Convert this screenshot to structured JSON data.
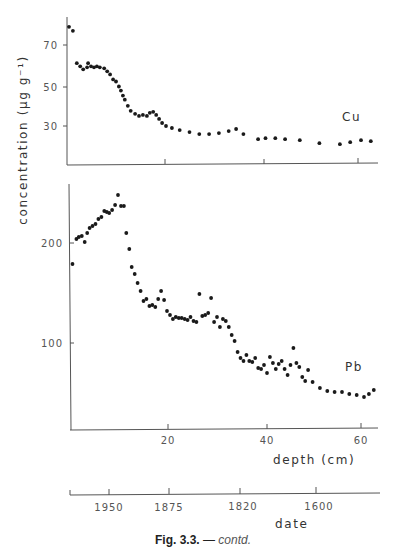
{
  "figure": {
    "caption_label": "Fig. 3.3.",
    "caption_sep": " — ",
    "caption_suffix": "contd."
  },
  "y_axis_title": "concentration (μg g⁻¹)",
  "chart_data": [
    {
      "type": "scatter",
      "title": "Cu",
      "panel_label": "Cu",
      "xlabel": "depth (cm)",
      "ylabel": "concentration (μg g⁻¹)",
      "xlim": [
        0,
        63
      ],
      "ylim": [
        10.5,
        84
      ],
      "xticks": [
        20,
        40,
        60
      ],
      "yticks": [
        30,
        50,
        70
      ],
      "grid": false,
      "x": [
        0.4,
        1.2,
        2,
        2.7,
        3.3,
        4.1,
        4.3,
        4.9,
        5.5,
        6.1,
        6.7,
        7.6,
        8.2,
        8.8,
        9.4,
        10,
        10.6,
        11,
        11.4,
        11.8,
        12.4,
        13,
        13.9,
        14.7,
        15.5,
        16.3,
        16.9,
        17.6,
        18.2,
        18.8,
        19.4,
        20.2,
        21.4,
        23,
        25,
        27,
        29,
        31,
        33,
        34.5,
        36,
        39,
        40.5,
        42.5,
        44.5,
        47.5,
        51.5,
        55.7,
        57.8,
        60,
        62
      ],
      "y": [
        79,
        77,
        61,
        59.5,
        58,
        59,
        61,
        59.5,
        59,
        59.5,
        59,
        58.5,
        57,
        55.5,
        53,
        52,
        49.5,
        47.5,
        45,
        43,
        40,
        37.5,
        36,
        35,
        35.5,
        35,
        36.5,
        37,
        35.5,
        33.5,
        31.5,
        30,
        29,
        28,
        27,
        26,
        26,
        26.5,
        27.5,
        28.5,
        26,
        23.5,
        24,
        24,
        23.5,
        23,
        21.5,
        21,
        22,
        23,
        22.5
      ]
    },
    {
      "type": "scatter",
      "title": "Pb",
      "panel_label": "Pb",
      "xlabel": "depth (cm)",
      "ylabel": "concentration (μg g⁻¹)",
      "xlim": [
        0,
        63
      ],
      "ylim": [
        14,
        259
      ],
      "xticks": [
        20,
        40,
        60
      ],
      "yticks": [
        100,
        200
      ],
      "grid": false,
      "x": [
        0.5,
        1.3,
        1.8,
        2.4,
        3,
        3.5,
        4,
        4.6,
        5.2,
        5.8,
        6.4,
        7,
        7.5,
        8,
        8.6,
        9.2,
        9.8,
        10.4,
        11,
        11.5,
        12.1,
        12.6,
        13.2,
        13.8,
        14.4,
        15,
        15.6,
        16.2,
        16.8,
        17.4,
        18,
        18.6,
        19.2,
        19.8,
        20.4,
        21,
        21.6,
        22.2,
        22.8,
        23.4,
        24,
        24.6,
        25.2,
        25.8,
        26.4,
        27,
        27.6,
        28.2,
        28.8,
        29.4,
        30,
        30.6,
        31.2,
        31.8,
        32.4,
        33,
        33.6,
        34.2,
        34.8,
        35.4,
        36,
        36.6,
        37.2,
        37.8,
        38.4,
        39,
        39.6,
        40.2,
        40.8,
        41.4,
        42,
        42.6,
        43.2,
        43.8,
        44.4,
        45,
        45.6,
        46.2,
        46.8,
        47.4,
        48,
        48.6,
        49.5,
        51,
        52.5,
        54,
        55.5,
        57,
        58.5,
        60,
        61,
        62
      ],
      "y": [
        179,
        204,
        206,
        207,
        201,
        210,
        215,
        217,
        219,
        224,
        226,
        232,
        231,
        230,
        233,
        238,
        248,
        237,
        237,
        210,
        194,
        176,
        169,
        160,
        152,
        142,
        144,
        137,
        138,
        136,
        144,
        152,
        143,
        132,
        128,
        124,
        126,
        125,
        125,
        124,
        123,
        126,
        122,
        121,
        149,
        127,
        128,
        130,
        145,
        121,
        126,
        116,
        124,
        122,
        116,
        108,
        102,
        91,
        85,
        82,
        88,
        82,
        81,
        85,
        75,
        74,
        78,
        70,
        86,
        80,
        74,
        79,
        82,
        74,
        68,
        78,
        95,
        80,
        76,
        66,
        62,
        73,
        61,
        55,
        52,
        51,
        51,
        49,
        48,
        46,
        49,
        53,
        51
      ]
    },
    {
      "type": "axis",
      "title": "date",
      "xlabel": "date",
      "tick_labels": [
        "1950",
        "1875",
        "1820",
        "1600"
      ]
    }
  ],
  "panels": {
    "cu": {
      "label": "Cu",
      "x_ticks": [
        "20",
        "40",
        "60"
      ],
      "y_ticks": [
        "30",
        "50",
        "70"
      ]
    },
    "pb": {
      "label": "Pb",
      "x_ticks": [
        "20",
        "40",
        "60"
      ],
      "y_ticks": [
        "100",
        "200"
      ],
      "x_title": "depth (cm)"
    },
    "date": {
      "ticks": [
        "1950",
        "1875",
        "1820",
        "1600"
      ],
      "title": "date"
    }
  },
  "colors": {
    "ink": "#1a1a1a",
    "axis": "#555555",
    "background": "#ffffff"
  }
}
